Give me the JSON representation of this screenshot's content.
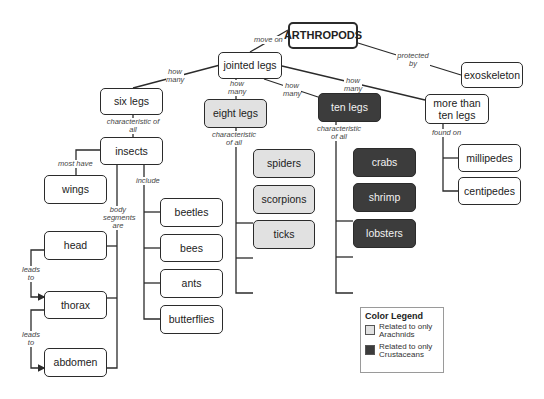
{
  "title": "ARTHROPODS",
  "nodes": {
    "arthropods": "ARTHROPODS",
    "jointed_legs": "jointed legs",
    "exoskeleton": "exoskeleton",
    "six_legs": "six legs",
    "eight_legs": "eight legs",
    "ten_legs": "ten legs",
    "more_than_ten_legs": "more than ten legs",
    "insects": "insects",
    "wings": "wings",
    "head": "head",
    "thorax": "thorax",
    "abdomen": "abdomen",
    "beetles": "beetles",
    "bees": "bees",
    "ants": "ants",
    "butterflies": "butterflies",
    "spiders": "spiders",
    "scorpions": "scorpions",
    "ticks": "ticks",
    "crabs": "crabs",
    "shrimp": "shrimp",
    "lobsters": "lobsters",
    "millipedes": "millipedes",
    "centipedes": "centipedes"
  },
  "links": {
    "move_on": "move on",
    "protected_by": "protected by",
    "how_many_six": "how many",
    "how_many_eight": "how many",
    "how_many_ten": "how many",
    "how_many_more": "how many",
    "char_six": "characteristic of all",
    "char_eight": "characteristic of all",
    "char_ten": "characteristic of all",
    "found_on": "found on",
    "most_have": "most have",
    "include": "include",
    "body_segments_are": "body segments are",
    "leads_to_1": "leads to",
    "leads_to_2": "leads to"
  },
  "legend": {
    "title": "Color Legend",
    "items": [
      {
        "label": "Related to only Arachnids",
        "color": "#e1e1e1"
      },
      {
        "label": "Related to only Crustaceans",
        "color": "#3c3c3c"
      }
    ]
  }
}
